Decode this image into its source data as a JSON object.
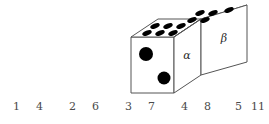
{
  "figure": {
    "colors": {
      "outline": "#555555",
      "pip": "#000000",
      "text": "#4a4a4a",
      "background": "#ffffff"
    },
    "labels": {
      "alpha": "α",
      "beta": "β"
    },
    "faces": {
      "front_left": {
        "name": "front-face",
        "pip_count": 2
      },
      "top_near": {
        "name": "top-face-alpha",
        "pip_count": 6
      },
      "top_far": {
        "name": "top-face-beta",
        "pip_count": 5
      },
      "side_alpha": {
        "name": "side-face-alpha",
        "label": "α"
      },
      "side_beta": {
        "name": "side-face-beta",
        "label": "β"
      }
    }
  },
  "number_row": {
    "pairs": [
      {
        "left": "1",
        "right": "4",
        "x": 6
      },
      {
        "left": "2",
        "right": "6",
        "x": 62
      },
      {
        "left": "3",
        "right": "7",
        "x": 118
      },
      {
        "left": "4",
        "right": "8",
        "x": 174
      },
      {
        "left": "5",
        "right": "11",
        "x": 228
      }
    ]
  }
}
